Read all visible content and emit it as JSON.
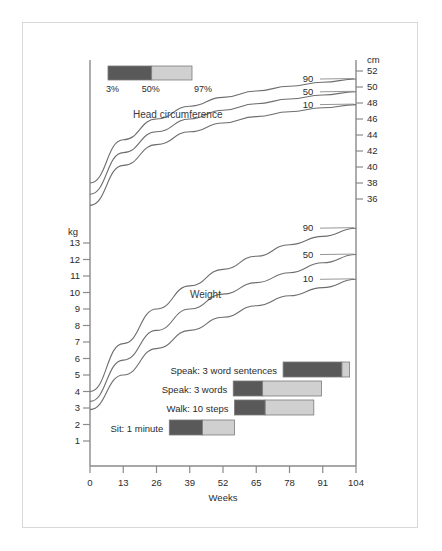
{
  "chart_data": {
    "type": "line",
    "title": "",
    "xlabel": "Weeks",
    "x_ticks": [
      0,
      13,
      26,
      39,
      52,
      65,
      78,
      91,
      104
    ],
    "xlim": [
      0,
      104
    ],
    "grid": false,
    "legend_position": "top-left",
    "left_axis": {
      "unit": "kg",
      "ticks": [
        13,
        12,
        11,
        10,
        9,
        8,
        7,
        6,
        5,
        4,
        3,
        2,
        1
      ],
      "ylim": [
        0,
        13.6
      ]
    },
    "right_axis": {
      "unit": "cm",
      "ticks": [
        52,
        50,
        48,
        46,
        44,
        42,
        40,
        38,
        36
      ],
      "ylim": [
        34.8,
        52.8
      ]
    },
    "panels": [
      {
        "name": "Head circumference",
        "label": "Head circumference",
        "unit": "cm",
        "axis": "right",
        "series": [
          {
            "name": "90",
            "percentile": 90,
            "x": [
              0,
              13,
              26,
              39,
              52,
              65,
              78,
              91,
              104
            ],
            "values": [
              38.0,
              43.4,
              46.0,
              47.6,
              48.7,
              49.5,
              50.1,
              50.6,
              51.0
            ]
          },
          {
            "name": "50",
            "percentile": 50,
            "x": [
              0,
              13,
              26,
              39,
              52,
              65,
              78,
              91,
              104
            ],
            "values": [
              36.6,
              41.8,
              44.4,
              46.0,
              47.1,
              47.9,
              48.5,
              49.0,
              49.4
            ]
          },
          {
            "name": "10",
            "percentile": 10,
            "x": [
              0,
              13,
              26,
              39,
              52,
              65,
              78,
              91,
              104
            ],
            "values": [
              35.2,
              40.2,
              42.8,
              44.4,
              45.5,
              46.3,
              46.9,
              47.4,
              47.8
            ]
          }
        ]
      },
      {
        "name": "Weight",
        "label": "Weight",
        "unit": "kg",
        "axis": "left",
        "series": [
          {
            "name": "90",
            "percentile": 90,
            "x": [
              0,
              13,
              26,
              39,
              52,
              65,
              78,
              91,
              104
            ],
            "values": [
              4.0,
              6.9,
              9.0,
              10.4,
              11.4,
              12.2,
              12.9,
              13.4,
              13.9
            ]
          },
          {
            "name": "50",
            "percentile": 50,
            "x": [
              0,
              13,
              26,
              39,
              52,
              65,
              78,
              91,
              104
            ],
            "values": [
              3.4,
              5.9,
              7.7,
              9.0,
              9.9,
              10.6,
              11.2,
              11.8,
              12.3
            ]
          },
          {
            "name": "10",
            "percentile": 10,
            "x": [
              0,
              13,
              26,
              39,
              52,
              65,
              78,
              91,
              104
            ],
            "values": [
              2.9,
              5.0,
              6.6,
              7.7,
              8.5,
              9.2,
              9.8,
              10.3,
              10.8
            ]
          }
        ]
      }
    ],
    "milestones": [
      {
        "label": "Speak: 3 word sentences",
        "start_weeks": 75.5,
        "median_weeks": 98.5,
        "end_weeks": 101.5
      },
      {
        "label": "Speak: 3  words",
        "start_weeks": 56.0,
        "median_weeks": 67.5,
        "end_weeks": 90.5
      },
      {
        "label": "Walk: 10 steps",
        "start_weeks": 56.5,
        "median_weeks": 68.5,
        "end_weeks": 87.5
      },
      {
        "label": "Sit: 1 minute",
        "start_weeks": 31.0,
        "median_weeks": 44.0,
        "end_weeks": 56.5
      }
    ],
    "legend": {
      "low_label": "3%",
      "mid_label": "50%",
      "high_label": "97%",
      "dark_color": "#595959",
      "light_color": "#d0d0d0"
    },
    "colors": {
      "curve": "#6e6e6e",
      "axis": "#8a8a8a",
      "text": "#2b2b2b",
      "frame": "#d8d8d8",
      "background": "#ffffff",
      "bar_dark": "#595959",
      "bar_light": "#d0d0d0",
      "bar_stroke": "#7a7a7a"
    }
  }
}
